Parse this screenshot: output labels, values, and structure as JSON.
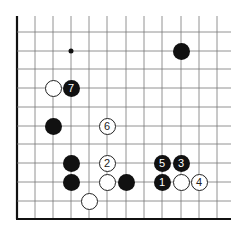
{
  "diagram": {
    "grid": {
      "xs": [
        17,
        35,
        53,
        71,
        89,
        107,
        126,
        144,
        162,
        181,
        199,
        217
      ],
      "ys": [
        32,
        51,
        69,
        88,
        107,
        126,
        144,
        163,
        182,
        201
      ],
      "right_end": 231,
      "top_end": 16,
      "bottom_edge": 219,
      "left_edge": 17
    },
    "hoshi": [
      {
        "x": 71,
        "y": 51
      }
    ],
    "stones": [
      {
        "color": "black",
        "x": 181,
        "y": 51,
        "label": ""
      },
      {
        "color": "white",
        "x": 53,
        "y": 88,
        "label": ""
      },
      {
        "color": "black",
        "x": 71,
        "y": 88,
        "label": "7"
      },
      {
        "color": "black",
        "x": 53,
        "y": 126,
        "label": ""
      },
      {
        "color": "white",
        "x": 107,
        "y": 126,
        "label": "6"
      },
      {
        "color": "black",
        "x": 71,
        "y": 163,
        "label": ""
      },
      {
        "color": "white",
        "x": 107,
        "y": 163,
        "label": "2"
      },
      {
        "color": "black",
        "x": 162,
        "y": 163,
        "label": "5"
      },
      {
        "color": "black",
        "x": 181,
        "y": 163,
        "label": "3"
      },
      {
        "color": "black",
        "x": 71,
        "y": 182,
        "label": ""
      },
      {
        "color": "white",
        "x": 107,
        "y": 182,
        "label": ""
      },
      {
        "color": "black",
        "x": 126,
        "y": 182,
        "label": ""
      },
      {
        "color": "black",
        "x": 162,
        "y": 182,
        "label": "1"
      },
      {
        "color": "white",
        "x": 181,
        "y": 182,
        "label": ""
      },
      {
        "color": "white",
        "x": 199,
        "y": 182,
        "label": "4"
      },
      {
        "color": "white",
        "x": 89,
        "y": 201,
        "label": ""
      }
    ]
  }
}
